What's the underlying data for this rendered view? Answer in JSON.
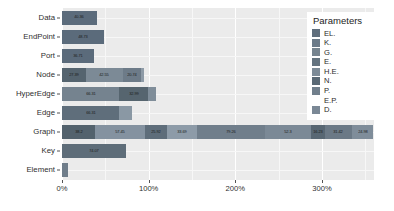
{
  "chart_data": {
    "type": "bar",
    "orientation": "horizontal",
    "stacked": true,
    "title": "",
    "xlabel": "",
    "ylabel": "",
    "xlim": [
      0,
      360
    ],
    "xticks": [
      0,
      100,
      200,
      300
    ],
    "xtick_labels": [
      "0%",
      "100%",
      "200%",
      "300%"
    ],
    "xtick_minor": [
      50,
      150,
      250,
      350
    ],
    "grid": true,
    "grid_color": "#ffffff",
    "panel_background": "#ebebeb",
    "legend_position": "right",
    "legend_title": "Parameters",
    "series": [
      {
        "name": "EL.",
        "color": "#5a6a7a"
      },
      {
        "name": "K.",
        "color": "#6e7d8c"
      },
      {
        "name": "G.",
        "color": "#8795a2"
      },
      {
        "name": "E.",
        "color": "#6b7a88"
      },
      {
        "name": "H.E.",
        "color": "#7e8c99"
      },
      {
        "name": "N.",
        "color": "#5f6e7d"
      },
      {
        "name": "P.",
        "color": "#74828f"
      },
      {
        "name": "E.P.",
        "color": "#69788６"
      },
      {
        "name": "D.",
        "color": "#808e9b"
      }
    ],
    "categories": [
      "Data",
      "EndPoint",
      "Port",
      "Node",
      "HyperEdge",
      "Edge",
      "Graph",
      "Key",
      "Element"
    ],
    "rows": [
      {
        "category": "Data",
        "segments": [
          {
            "series": "EL.",
            "value": 40.36,
            "label": "40.36",
            "color": "#5b6b7b"
          }
        ]
      },
      {
        "category": "EndPoint",
        "segments": [
          {
            "series": "EL.",
            "value": 48.73,
            "label": "48.73",
            "color": "#5b6b7b"
          }
        ]
      },
      {
        "category": "Port",
        "segments": [
          {
            "series": "EL.",
            "value": 36.71,
            "label": "36.71",
            "color": "#5b6b7b"
          }
        ]
      },
      {
        "category": "Node",
        "segments": [
          {
            "series": "EL.",
            "value": 27.39,
            "label": "27.39",
            "color": "#55646f"
          },
          {
            "series": "K.",
            "value": 42.55,
            "label": "42.55",
            "color": "#7c8a96"
          },
          {
            "series": "G.",
            "value": 20.74,
            "label": "20.74",
            "color": "#6d7b88"
          },
          {
            "series": "E.",
            "value": 4.2,
            "label": "",
            "color": "#8e9ba7"
          }
        ]
      },
      {
        "category": "HyperEdge",
        "segments": [
          {
            "series": "EL.",
            "value": 66.31,
            "label": "66.31",
            "color": "#75838f"
          },
          {
            "series": "K.",
            "value": 32.99,
            "label": "32.99",
            "color": "#56656f"
          },
          {
            "series": "G.",
            "value": 9.0,
            "label": "",
            "color": "#7f8d99"
          }
        ]
      },
      {
        "category": "Edge",
        "segments": [
          {
            "series": "EL.",
            "value": 66.31,
            "label": "66.31",
            "color": "#5f6e7b"
          },
          {
            "series": "K.",
            "value": 14.5,
            "label": "",
            "color": "#8a98a4"
          }
        ]
      },
      {
        "category": "Graph",
        "segments": [
          {
            "series": "EL.",
            "value": 38.2,
            "label": "38.2",
            "color": "#53626d"
          },
          {
            "series": "K.",
            "value": 57.45,
            "label": "57.45",
            "color": "#8492a0"
          },
          {
            "series": "G.",
            "value": 25.92,
            "label": "25.92",
            "color": "#5e6d7a"
          },
          {
            "series": "E.",
            "value": 33.69,
            "label": "33.69",
            "color": "#8d9ba8"
          },
          {
            "series": "H.E.",
            "value": 79.26,
            "label": "79.26",
            "color": "#707e8b"
          },
          {
            "series": "N.",
            "value": 52.3,
            "label": "52.3",
            "color": "#7b8996"
          },
          {
            "series": "P.",
            "value": 16.23,
            "label": "16.23",
            "color": "#586773"
          },
          {
            "series": "E.P.",
            "value": 31.42,
            "label": "31.42",
            "color": "#6b7986"
          },
          {
            "series": "D.",
            "value": 24.98,
            "label": "24.98",
            "color": "#7f8d9a"
          }
        ]
      },
      {
        "category": "Key",
        "segments": [
          {
            "series": "EL.",
            "value": 74.07,
            "label": "74.07",
            "color": "#5e6d79"
          }
        ]
      },
      {
        "category": "Element",
        "segments": [
          {
            "series": "EL.",
            "value": 6.5,
            "label": "",
            "color": "#6f7d8a"
          }
        ]
      }
    ]
  },
  "legend": {
    "title": "Parameters",
    "items": [
      {
        "label": "EL.",
        "color": "#5f6e7c"
      },
      {
        "label": "K.",
        "color": "#6b7a88"
      },
      {
        "label": "G.",
        "color": "#76848f"
      },
      {
        "label": "E.",
        "color": "#64737f"
      },
      {
        "label": "H.E.",
        "color": "#7d8b97"
      },
      {
        "label": "N.",
        "color": "#5a6975"
      },
      {
        "label": "P.",
        "color": "#717f8c"
      },
      {
        "label": "E.P.",
        "color": "#69778３"
      },
      {
        "label": "D.",
        "color": "#7a8895"
      }
    ]
  },
  "axes": {
    "y_categories": [
      "Data",
      "EndPoint",
      "Port",
      "Node",
      "HyperEdge",
      "Edge",
      "Graph",
      "Key",
      "Element"
    ],
    "x_tick_labels": [
      "0%",
      "100%",
      "200%",
      "300%"
    ]
  }
}
